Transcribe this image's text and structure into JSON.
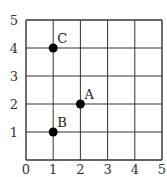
{
  "chart_data": {
    "type": "scatter",
    "title": "",
    "xlabel": "",
    "ylabel": "",
    "xlim": [
      0,
      5
    ],
    "ylim": [
      0,
      5
    ],
    "grid": true,
    "x_ticks": [
      "0",
      "1",
      "2",
      "3",
      "4",
      "5"
    ],
    "y_ticks": [
      "1",
      "2",
      "3",
      "4",
      "5"
    ],
    "points": [
      {
        "label": "A",
        "x": 2,
        "y": 2
      },
      {
        "label": "B",
        "x": 1,
        "y": 1
      },
      {
        "label": "C",
        "x": 1,
        "y": 4
      }
    ],
    "colors": {
      "grid": "#333333",
      "point": "#000000"
    }
  }
}
